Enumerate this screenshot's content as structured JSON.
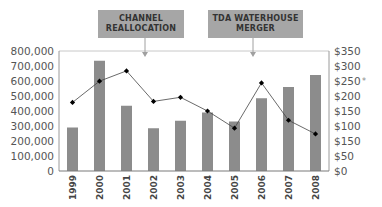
{
  "chart_data": {
    "type": "bar",
    "title": "",
    "categories": [
      "1999",
      "2000",
      "2001",
      "2002",
      "2003",
      "2004",
      "2005",
      "2006",
      "2007",
      "2008"
    ],
    "series": [
      {
        "name": "Volume",
        "type": "bar",
        "axis": "left",
        "color": "#8c8c8c",
        "values": [
          290000,
          735000,
          435000,
          285000,
          335000,
          390000,
          330000,
          485000,
          560000,
          640000
        ]
      },
      {
        "name": "Price",
        "type": "line",
        "axis": "right",
        "color": "#000000",
        "values": [
          200,
          262,
          292,
          203,
          215,
          175,
          125,
          257,
          148,
          108
        ]
      }
    ],
    "left_axis": {
      "ylim": [
        0,
        800000
      ],
      "ticks": [
        "0",
        "100,000",
        "200,000",
        "300,000",
        "400,000",
        "500,000",
        "600,000",
        "700,000",
        "800,000"
      ]
    },
    "right_axis": {
      "ylim": [
        0,
        350
      ],
      "ticks": [
        "$0",
        "$50",
        "$150",
        "$100",
        "$150",
        "$200",
        "$250",
        "$300",
        "$350"
      ]
    },
    "xlabel": "",
    "ylabel": "",
    "grid": false,
    "legend": null,
    "annotations": [
      {
        "text_lines": [
          "CHANNEL",
          "REALLOCATION"
        ],
        "between": [
          "2001",
          "2002"
        ]
      },
      {
        "text_lines": [
          "TDA WATERHOUSE",
          "MERGER"
        ],
        "between": [
          "2005",
          "2006"
        ]
      }
    ],
    "stray_mark": "*"
  }
}
